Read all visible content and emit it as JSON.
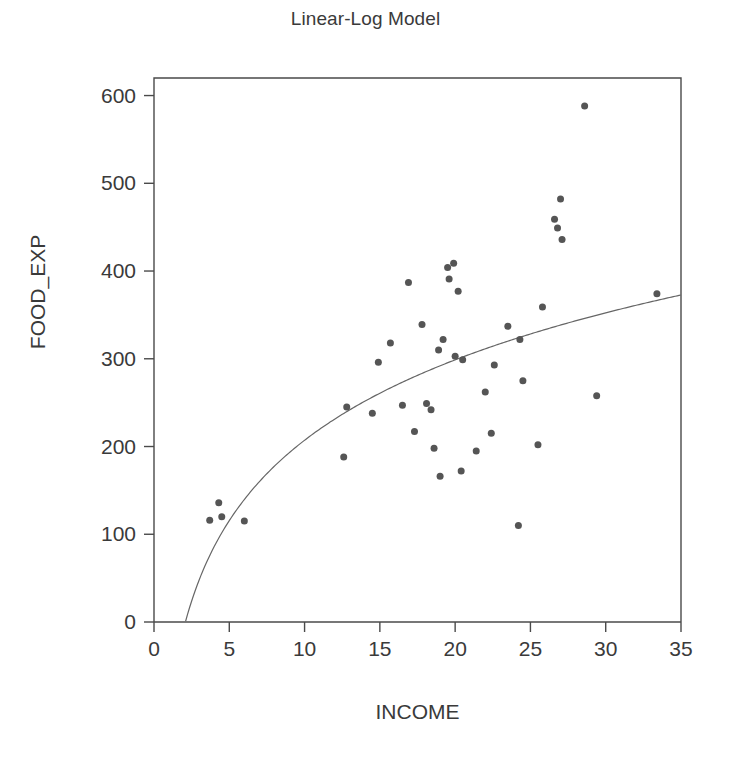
{
  "chart_data": {
    "type": "scatter",
    "title": "Linear-Log Model",
    "xlabel": "INCOME",
    "ylabel": "FOOD_EXP",
    "xlim": [
      0,
      35
    ],
    "ylim": [
      0,
      620
    ],
    "xticks": [
      0,
      5,
      10,
      15,
      20,
      25,
      30,
      35
    ],
    "yticks": [
      0,
      100,
      200,
      300,
      400,
      500,
      600
    ],
    "grid": false,
    "legend": null,
    "marker": {
      "shape": "circle",
      "color": "#555555",
      "size": 7
    },
    "points": [
      {
        "x": 3.7,
        "y": 116
      },
      {
        "x": 4.3,
        "y": 136
      },
      {
        "x": 4.5,
        "y": 120
      },
      {
        "x": 6.0,
        "y": 115
      },
      {
        "x": 12.6,
        "y": 188
      },
      {
        "x": 12.8,
        "y": 245
      },
      {
        "x": 14.5,
        "y": 238
      },
      {
        "x": 14.9,
        "y": 296
      },
      {
        "x": 15.7,
        "y": 318
      },
      {
        "x": 16.5,
        "y": 247
      },
      {
        "x": 16.9,
        "y": 387
      },
      {
        "x": 17.3,
        "y": 217
      },
      {
        "x": 17.8,
        "y": 339
      },
      {
        "x": 18.1,
        "y": 249
      },
      {
        "x": 18.4,
        "y": 242
      },
      {
        "x": 18.6,
        "y": 198
      },
      {
        "x": 18.9,
        "y": 310
      },
      {
        "x": 19.0,
        "y": 166
      },
      {
        "x": 19.2,
        "y": 322
      },
      {
        "x": 19.5,
        "y": 404
      },
      {
        "x": 19.6,
        "y": 391
      },
      {
        "x": 19.9,
        "y": 409
      },
      {
        "x": 20.0,
        "y": 303
      },
      {
        "x": 20.2,
        "y": 377
      },
      {
        "x": 20.4,
        "y": 172
      },
      {
        "x": 20.5,
        "y": 299
      },
      {
        "x": 21.4,
        "y": 195
      },
      {
        "x": 22.0,
        "y": 262
      },
      {
        "x": 22.4,
        "y": 215
      },
      {
        "x": 22.6,
        "y": 293
      },
      {
        "x": 23.5,
        "y": 337
      },
      {
        "x": 24.2,
        "y": 110
      },
      {
        "x": 24.3,
        "y": 322
      },
      {
        "x": 24.5,
        "y": 275
      },
      {
        "x": 25.5,
        "y": 202
      },
      {
        "x": 25.8,
        "y": 359
      },
      {
        "x": 26.6,
        "y": 459
      },
      {
        "x": 26.8,
        "y": 449
      },
      {
        "x": 27.0,
        "y": 482
      },
      {
        "x": 27.1,
        "y": 436
      },
      {
        "x": 28.6,
        "y": 588
      },
      {
        "x": 29.4,
        "y": 258
      },
      {
        "x": 33.4,
        "y": 374
      }
    ],
    "fit_curve": {
      "label": "linear-log fit",
      "equation_form": "y = a + b*ln(x)",
      "a": -97.19,
      "b": 132.17,
      "color": "#666666",
      "x_start": 2.1,
      "x_end": 35.0
    }
  },
  "axes_geometry": {
    "plot_left_px": 154,
    "plot_right_px": 681,
    "plot_top_px": 78,
    "plot_bottom_px": 622
  }
}
